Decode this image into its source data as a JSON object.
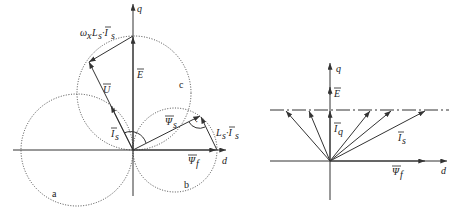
{
  "figure": {
    "left_diagram": {
      "axes": {
        "q_label": "q",
        "d_label": "d"
      },
      "vectors": {
        "E": {
          "label": "E",
          "overbar": true
        },
        "U": {
          "label": "U",
          "overbar": true
        },
        "Is": {
          "label": "I",
          "sub": "s",
          "overbar": true
        },
        "Psi_s": {
          "label": "Ψ",
          "sub": "s",
          "overbar": true
        },
        "Psi_f": {
          "label": "Ψ",
          "sub": "f",
          "overbar": true
        },
        "LsIs": {
          "label": "L",
          "sub": "s",
          "suffix": "·I",
          "suffix_sub": "s"
        },
        "omegaLsIs": {
          "prefix": "ω",
          "prefix_sub": "x",
          "label": "L",
          "sub": "s",
          "suffix": "·I",
          "suffix_sub": "s"
        }
      },
      "circles": {
        "a": "a",
        "b": "b",
        "c": "c"
      }
    },
    "right_diagram": {
      "axes": {
        "q_label": "q",
        "d_label": "d"
      },
      "vectors": {
        "E": {
          "label": "E"
        },
        "Iq": {
          "label": "I",
          "sub": "q"
        },
        "Is": {
          "label": "I",
          "sub": "s"
        },
        "Psi_f": {
          "label": "Ψ",
          "sub": "f"
        }
      }
    }
  }
}
